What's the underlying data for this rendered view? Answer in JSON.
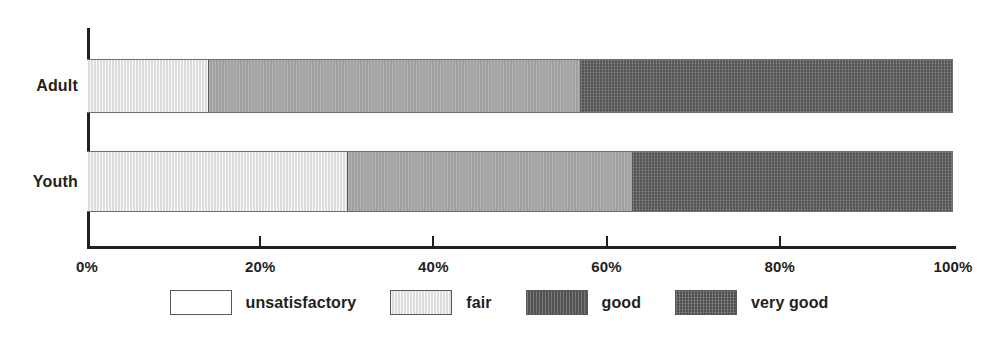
{
  "chart_data": {
    "type": "bar",
    "orientation": "horizontal",
    "stacked": true,
    "normalized": true,
    "title": "",
    "subtitle": "",
    "xlabel": "",
    "ylabel": "",
    "categories": [
      "Adult",
      "Youth"
    ],
    "xlim": [
      0,
      100
    ],
    "xticks": [
      0,
      20,
      40,
      60,
      80,
      100
    ],
    "xtick_labels": [
      "0%",
      "20%",
      "40%",
      "60%",
      "80%",
      "100%"
    ],
    "grid": false,
    "legend_position": "bottom",
    "series": [
      {
        "name": "unsatisfactory",
        "key": "unsatisfactory",
        "color": "#ffffff",
        "values": [
          0,
          0
        ]
      },
      {
        "name": "fair",
        "key": "fair",
        "color": "#e3e3e1",
        "values": [
          14,
          30
        ]
      },
      {
        "name": "good",
        "key": "good",
        "color": "#a7a9ab",
        "values": [
          43,
          33
        ]
      },
      {
        "name": "very good",
        "key": "very-good",
        "color": "#636466",
        "values": [
          43,
          37
        ]
      }
    ],
    "bars": [
      {
        "category": "Adult",
        "segments": [
          {
            "label": "unsatisfactory",
            "key": "unsatisfactory",
            "value": 0
          },
          {
            "label": "fair",
            "key": "fair",
            "value": 14
          },
          {
            "label": "good",
            "key": "good",
            "value": 43
          },
          {
            "label": "very good",
            "key": "very-good",
            "value": 43
          }
        ]
      },
      {
        "category": "Youth",
        "segments": [
          {
            "label": "unsatisfactory",
            "key": "unsatisfactory",
            "value": 0
          },
          {
            "label": "fair",
            "key": "fair",
            "value": 30
          },
          {
            "label": "good",
            "key": "good",
            "value": 33
          },
          {
            "label": "very good",
            "key": "very-good",
            "value": 37
          }
        ]
      }
    ]
  },
  "legend": {
    "items": [
      {
        "label": "unsatisfactory",
        "key": "unsatisfactory"
      },
      {
        "label": "fair",
        "key": "fair"
      },
      {
        "label": "good",
        "key": "good"
      },
      {
        "label": "very good",
        "key": "very-good"
      }
    ]
  },
  "axis": {
    "tick_labels": [
      "0%",
      "20%",
      "40%",
      "60%",
      "80%",
      "100%"
    ]
  },
  "colors": {
    "axis": "#231f20",
    "bar_outline": "#6d6e70",
    "unsatisfactory": "#ffffff",
    "fair": "#e3e3e1",
    "good": "#a7a9ab",
    "very_good": "#636466"
  }
}
